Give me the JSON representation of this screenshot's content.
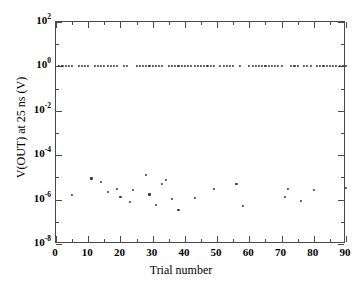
{
  "chart_data": {
    "type": "scatter",
    "title": "",
    "xlabel": "Trial number",
    "ylabel": "V(OUT) at 25 ns (V)",
    "xlim": [
      0,
      90
    ],
    "ylim": [
      1e-08,
      100
    ],
    "yscale": "log",
    "xscale": "linear",
    "grid": false,
    "legend": null,
    "xticks": [
      0,
      10,
      20,
      30,
      40,
      50,
      60,
      70,
      80,
      90
    ],
    "xtick_labels": [
      "0",
      "10",
      "20",
      "30",
      "40",
      "50",
      "60",
      "70",
      "80",
      "90"
    ],
    "xminor_step": 5,
    "yticks": [
      100,
      1,
      0.01,
      0.0001,
      1e-06,
      1e-08
    ],
    "ytick_labels": [
      "10²",
      "10⁰",
      "10⁻²",
      "10⁻⁴",
      "10⁻⁶",
      "10⁻⁸"
    ],
    "ytick_mantissa": "10",
    "ytick_exponents": [
      "2",
      "0",
      "-2",
      "-4",
      "-6",
      "-8"
    ],
    "marker": "dot",
    "marker_color": "#35353a",
    "series": [
      {
        "name": "high-state outcomes",
        "x": [
          1,
          2,
          3,
          4,
          5,
          7,
          8,
          9,
          10,
          12,
          13,
          14,
          15,
          16,
          17,
          18,
          19,
          21,
          22,
          25,
          26,
          27,
          28,
          29,
          30,
          31,
          32,
          33,
          35,
          36,
          37,
          38,
          39,
          40,
          41,
          42,
          43,
          44,
          45,
          46,
          47,
          48,
          49,
          51,
          52,
          53,
          54,
          55,
          57,
          60,
          61,
          62,
          63,
          64,
          65,
          66,
          67,
          68,
          69,
          70,
          73,
          74,
          75,
          77,
          78,
          79,
          81,
          82,
          83,
          84,
          85,
          86,
          87,
          88,
          89,
          90
        ],
        "y": [
          1.0,
          1.0,
          1.0,
          1.0,
          1.0,
          1.0,
          1.0,
          1.0,
          1.0,
          1.0,
          1.0,
          1.0,
          1.0,
          1.0,
          1.0,
          1.0,
          1.0,
          1.0,
          1.0,
          1.0,
          1.0,
          1.0,
          1.0,
          1.0,
          1.0,
          1.0,
          1.0,
          1.0,
          1.0,
          1.0,
          1.0,
          1.0,
          1.0,
          1.0,
          1.0,
          1.0,
          1.0,
          1.0,
          1.0,
          1.0,
          1.0,
          1.0,
          1.0,
          1.0,
          1.0,
          1.0,
          1.0,
          1.0,
          1.0,
          1.0,
          1.0,
          1.0,
          1.0,
          1.0,
          1.0,
          1.0,
          1.0,
          1.0,
          1.0,
          1.0,
          1.0,
          1.0,
          1.0,
          1.0,
          1.0,
          1.0,
          1.0,
          1.0,
          1.0,
          1.0,
          1.0,
          1.0,
          1.0,
          1.0,
          1.0,
          1.0
        ]
      },
      {
        "name": "low-state outcomes",
        "x": [
          5,
          11,
          14,
          16,
          19,
          20,
          23,
          24,
          28,
          29,
          31,
          33,
          34,
          36,
          38,
          43,
          49,
          56,
          58,
          71,
          72,
          76,
          80,
          90
        ],
        "y": [
          1.6e-06,
          9e-06,
          6.5e-06,
          2.2e-06,
          3e-06,
          1.3e-06,
          8e-07,
          2.6e-06,
          1.3e-05,
          1.7e-06,
          6e-07,
          5e-06,
          8e-06,
          1.1e-06,
          3.5e-07,
          1.2e-06,
          3e-06,
          5.2e-06,
          5e-07,
          1.3e-06,
          3e-06,
          9e-07,
          2.8e-06,
          3.2e-06
        ]
      }
    ]
  }
}
